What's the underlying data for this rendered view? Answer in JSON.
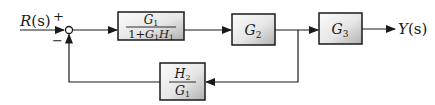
{
  "diagram": {
    "type": "block-diagram",
    "input": {
      "label": "R(s)",
      "name": "R",
      "arg": "(s)"
    },
    "output": {
      "label": "Y(s)",
      "name": "Y",
      "arg": "(s)"
    },
    "summing_junction": {
      "plus_sign": "+",
      "minus_sign": "−"
    },
    "blocks": {
      "forward1": {
        "numerator": "G",
        "numerator_sub": "1",
        "denominator": "1+G",
        "denominator_sub1": "1",
        "denominator_mid": "H",
        "denominator_sub2": "1",
        "text": "G1 / (1+G1H1)"
      },
      "forward2": {
        "main": "G",
        "sub": "2",
        "text": "G2"
      },
      "forward3": {
        "main": "G",
        "sub": "3",
        "text": "G3"
      },
      "feedback": {
        "numerator": "H",
        "numerator_sub": "2",
        "denominator": "G",
        "denominator_sub": "1",
        "text": "H2 / G1"
      }
    },
    "colors": {
      "line": "#1a1a1a",
      "block_fill_light": "#f8f8f8",
      "block_fill_dark": "#b8b8b8",
      "block_border": "#1a1a1a"
    }
  }
}
